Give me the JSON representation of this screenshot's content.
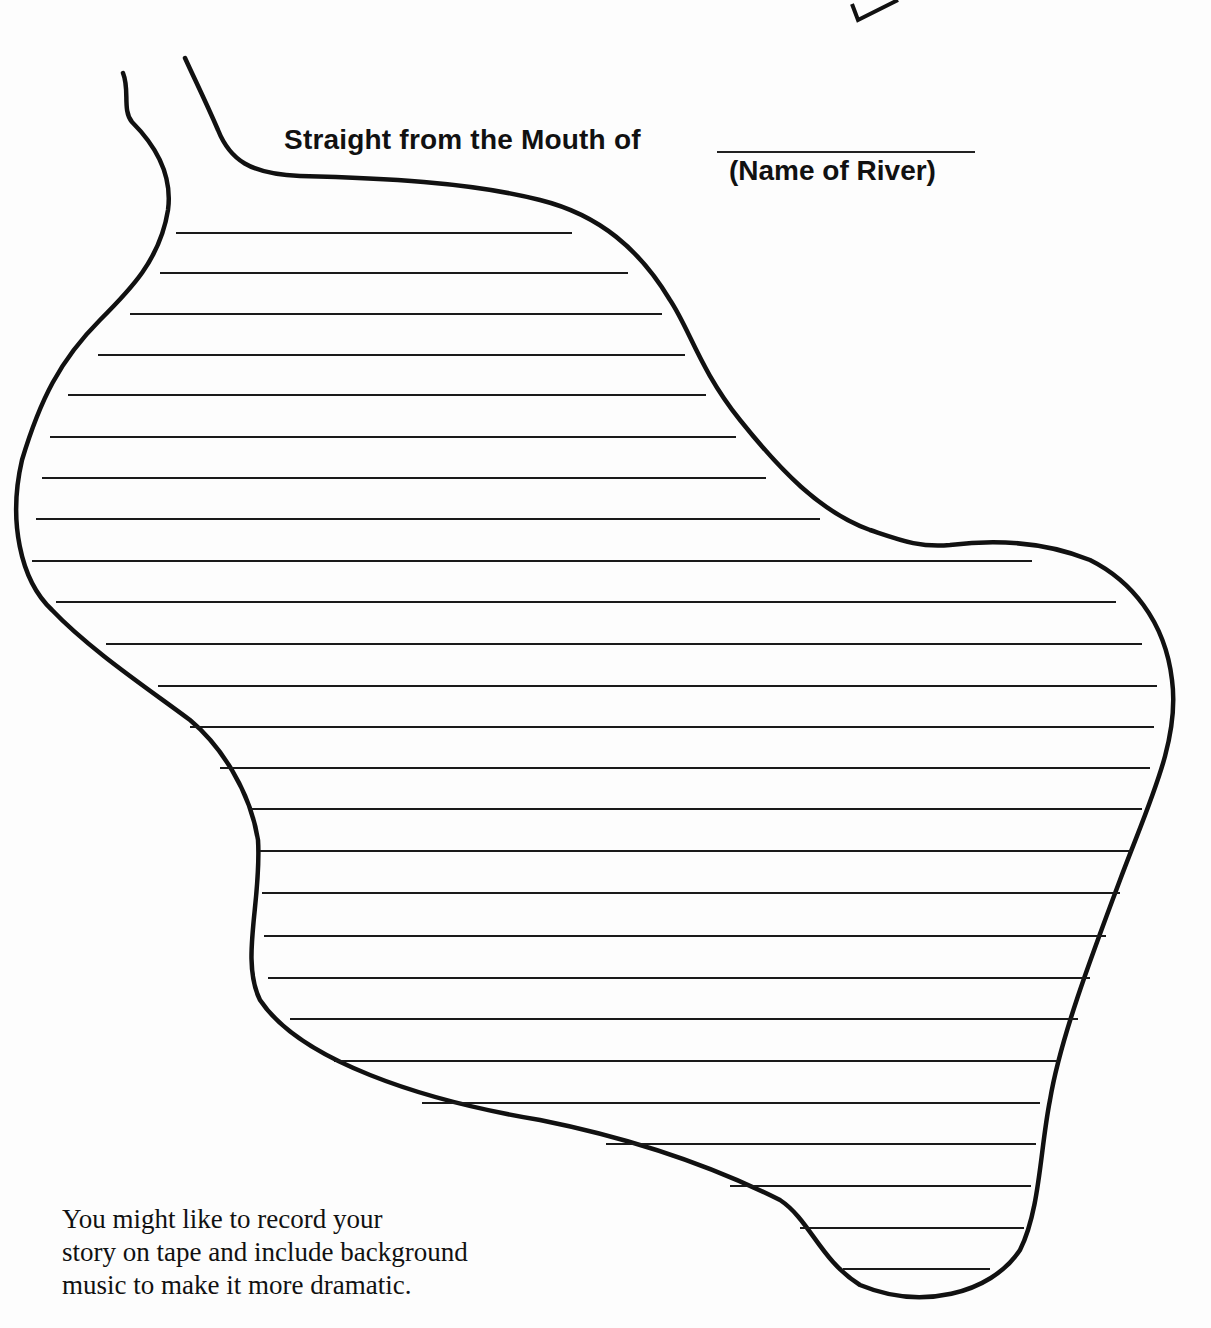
{
  "worksheet": {
    "title": "Straight from the Mouth of",
    "blank_label": "(Name of River)",
    "note_lines": [
      "You might like to record your",
      "story on tape and include background",
      "music to make it more dramatic."
    ],
    "writing_lines": [
      {
        "x1": 176,
        "x2": 572,
        "y": 232
      },
      {
        "x1": 160,
        "x2": 628,
        "y": 272
      },
      {
        "x1": 130,
        "x2": 662,
        "y": 313
      },
      {
        "x1": 98,
        "x2": 685,
        "y": 354
      },
      {
        "x1": 68,
        "x2": 706,
        "y": 394
      },
      {
        "x1": 50,
        "x2": 736,
        "y": 436
      },
      {
        "x1": 42,
        "x2": 766,
        "y": 477
      },
      {
        "x1": 36,
        "x2": 820,
        "y": 518
      },
      {
        "x1": 32,
        "x2": 1032,
        "y": 560
      },
      {
        "x1": 56,
        "x2": 1116,
        "y": 601
      },
      {
        "x1": 106,
        "x2": 1142,
        "y": 643
      },
      {
        "x1": 158,
        "x2": 1157,
        "y": 685
      },
      {
        "x1": 190,
        "x2": 1154,
        "y": 726
      },
      {
        "x1": 220,
        "x2": 1150,
        "y": 767
      },
      {
        "x1": 250,
        "x2": 1142,
        "y": 808
      },
      {
        "x1": 260,
        "x2": 1132,
        "y": 850
      },
      {
        "x1": 262,
        "x2": 1120,
        "y": 892
      },
      {
        "x1": 264,
        "x2": 1106,
        "y": 935
      },
      {
        "x1": 268,
        "x2": 1090,
        "y": 977
      },
      {
        "x1": 290,
        "x2": 1078,
        "y": 1018
      },
      {
        "x1": 334,
        "x2": 1058,
        "y": 1060
      },
      {
        "x1": 422,
        "x2": 1040,
        "y": 1102
      },
      {
        "x1": 606,
        "x2": 1036,
        "y": 1143
      },
      {
        "x1": 730,
        "x2": 1031,
        "y": 1185
      },
      {
        "x1": 800,
        "x2": 1024,
        "y": 1227
      },
      {
        "x1": 843,
        "x2": 990,
        "y": 1268
      }
    ]
  },
  "colors": {
    "ink": "#111111",
    "paper": "#fdfdfd"
  }
}
